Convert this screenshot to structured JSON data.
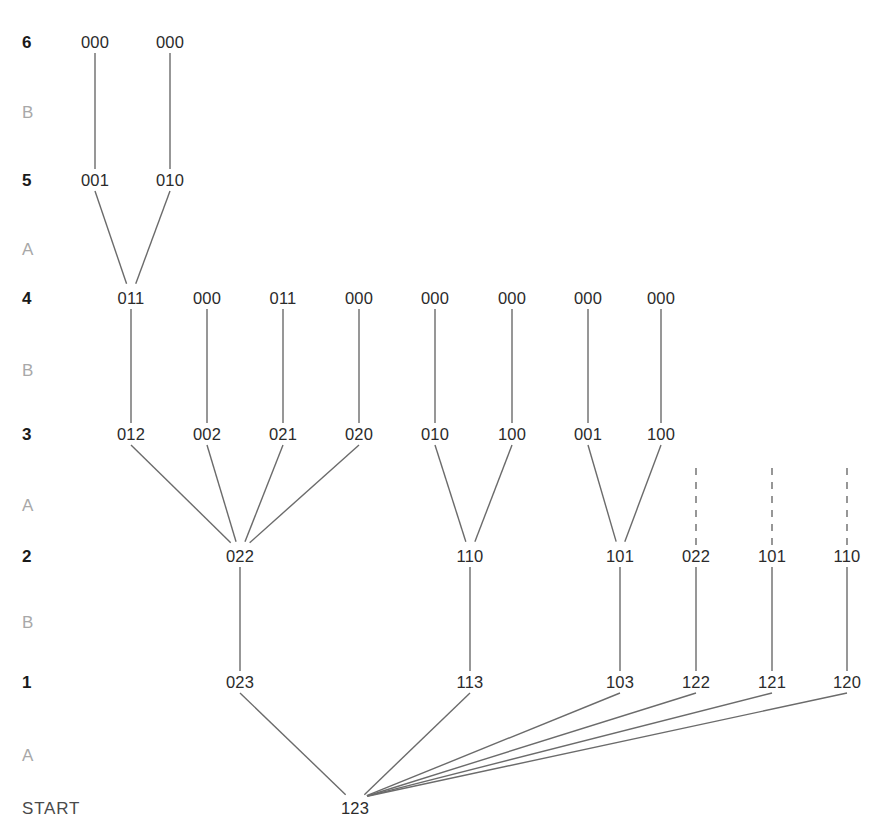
{
  "diagram": {
    "background_color": "#ffffff",
    "edge_color": "#6b6b6b",
    "node_text_color": "#2b2b2b",
    "level_label_color": "#1a1a1a",
    "phase_label_color": "#a8a8a8",
    "start_label_color": "#4a4a4a"
  },
  "axis": {
    "rows": [
      {
        "id": "lvl6",
        "label": "6",
        "kind": "level",
        "y": 42
      },
      {
        "id": "phB3",
        "label": "B",
        "kind": "phase",
        "y": 112
      },
      {
        "id": "lvl5",
        "label": "5",
        "kind": "level",
        "y": 180
      },
      {
        "id": "phA3",
        "label": "A",
        "kind": "phase",
        "y": 249
      },
      {
        "id": "lvl4",
        "label": "4",
        "kind": "level",
        "y": 298
      },
      {
        "id": "phB2",
        "label": "B",
        "kind": "phase",
        "y": 370
      },
      {
        "id": "lvl3",
        "label": "3",
        "kind": "level",
        "y": 434
      },
      {
        "id": "phA2",
        "label": "A",
        "kind": "phase",
        "y": 505
      },
      {
        "id": "lvl2",
        "label": "2",
        "kind": "level",
        "y": 556
      },
      {
        "id": "phB1",
        "label": "B",
        "kind": "phase",
        "y": 622
      },
      {
        "id": "lvl1",
        "label": "1",
        "kind": "level",
        "y": 682
      },
      {
        "id": "phA1",
        "label": "A",
        "kind": "phase",
        "y": 755
      },
      {
        "id": "start",
        "label": "START",
        "kind": "start",
        "y": 808
      }
    ],
    "x": 22
  },
  "nodes": [
    {
      "id": "n6a",
      "label": "000",
      "x": 95,
      "y": 42,
      "row": "6"
    },
    {
      "id": "n6b",
      "label": "000",
      "x": 170,
      "y": 42,
      "row": "6"
    },
    {
      "id": "n5a",
      "label": "001",
      "x": 95,
      "y": 180,
      "row": "5"
    },
    {
      "id": "n5b",
      "label": "010",
      "x": 170,
      "y": 180,
      "row": "5"
    },
    {
      "id": "n4a",
      "label": "011",
      "x": 131,
      "y": 298,
      "row": "4"
    },
    {
      "id": "n4b",
      "label": "000",
      "x": 207,
      "y": 298,
      "row": "4"
    },
    {
      "id": "n4c",
      "label": "011",
      "x": 283,
      "y": 298,
      "row": "4"
    },
    {
      "id": "n4d",
      "label": "000",
      "x": 359,
      "y": 298,
      "row": "4"
    },
    {
      "id": "n4e",
      "label": "000",
      "x": 435,
      "y": 298,
      "row": "4"
    },
    {
      "id": "n4f",
      "label": "000",
      "x": 512,
      "y": 298,
      "row": "4"
    },
    {
      "id": "n4g",
      "label": "000",
      "x": 588,
      "y": 298,
      "row": "4"
    },
    {
      "id": "n4h",
      "label": "000",
      "x": 661,
      "y": 298,
      "row": "4"
    },
    {
      "id": "n3a",
      "label": "012",
      "x": 131,
      "y": 434,
      "row": "3"
    },
    {
      "id": "n3b",
      "label": "002",
      "x": 207,
      "y": 434,
      "row": "3"
    },
    {
      "id": "n3c",
      "label": "021",
      "x": 283,
      "y": 434,
      "row": "3"
    },
    {
      "id": "n3d",
      "label": "020",
      "x": 359,
      "y": 434,
      "row": "3"
    },
    {
      "id": "n3e",
      "label": "010",
      "x": 435,
      "y": 434,
      "row": "3"
    },
    {
      "id": "n3f",
      "label": "100",
      "x": 512,
      "y": 434,
      "row": "3"
    },
    {
      "id": "n3g",
      "label": "001",
      "x": 588,
      "y": 434,
      "row": "3"
    },
    {
      "id": "n3h",
      "label": "100",
      "x": 661,
      "y": 434,
      "row": "3"
    },
    {
      "id": "n2a",
      "label": "022",
      "x": 240,
      "y": 556,
      "row": "2"
    },
    {
      "id": "n2b",
      "label": "110",
      "x": 470,
      "y": 556,
      "row": "2"
    },
    {
      "id": "n2c",
      "label": "101",
      "x": 620,
      "y": 556,
      "row": "2"
    },
    {
      "id": "n2d",
      "label": "022",
      "x": 696,
      "y": 556,
      "row": "2"
    },
    {
      "id": "n2e",
      "label": "101",
      "x": 772,
      "y": 556,
      "row": "2"
    },
    {
      "id": "n2f",
      "label": "110",
      "x": 847,
      "y": 556,
      "row": "2"
    },
    {
      "id": "n1a",
      "label": "023",
      "x": 240,
      "y": 682,
      "row": "1"
    },
    {
      "id": "n1b",
      "label": "113",
      "x": 470,
      "y": 682,
      "row": "1"
    },
    {
      "id": "n1c",
      "label": "103",
      "x": 620,
      "y": 682,
      "row": "1"
    },
    {
      "id": "n1d",
      "label": "122",
      "x": 696,
      "y": 682,
      "row": "1"
    },
    {
      "id": "n1e",
      "label": "121",
      "x": 772,
      "y": 682,
      "row": "1"
    },
    {
      "id": "n1f",
      "label": "120",
      "x": 847,
      "y": 682,
      "row": "1"
    },
    {
      "id": "n0",
      "label": "123",
      "x": 355,
      "y": 808,
      "row": "START"
    }
  ],
  "edges": [
    {
      "from": "n5a",
      "to": "n6a",
      "style": "solid"
    },
    {
      "from": "n5b",
      "to": "n6b",
      "style": "solid"
    },
    {
      "from": "n4a",
      "to": "n5a",
      "style": "solid"
    },
    {
      "from": "n4a",
      "to": "n5b",
      "style": "solid"
    },
    {
      "from": "n3a",
      "to": "n4a",
      "style": "solid"
    },
    {
      "from": "n3b",
      "to": "n4b",
      "style": "solid"
    },
    {
      "from": "n3c",
      "to": "n4c",
      "style": "solid"
    },
    {
      "from": "n3d",
      "to": "n4d",
      "style": "solid"
    },
    {
      "from": "n3e",
      "to": "n4e",
      "style": "solid"
    },
    {
      "from": "n3f",
      "to": "n4f",
      "style": "solid"
    },
    {
      "from": "n3g",
      "to": "n4g",
      "style": "solid"
    },
    {
      "from": "n3h",
      "to": "n4h",
      "style": "solid"
    },
    {
      "from": "n2a",
      "to": "n3a",
      "style": "solid"
    },
    {
      "from": "n2a",
      "to": "n3b",
      "style": "solid"
    },
    {
      "from": "n2a",
      "to": "n3c",
      "style": "solid"
    },
    {
      "from": "n2a",
      "to": "n3d",
      "style": "solid"
    },
    {
      "from": "n2b",
      "to": "n3e",
      "style": "solid"
    },
    {
      "from": "n2b",
      "to": "n3f",
      "style": "solid"
    },
    {
      "from": "n2c",
      "to": "n3g",
      "style": "solid"
    },
    {
      "from": "n2c",
      "to": "n3h",
      "style": "solid"
    },
    {
      "from": "n2d",
      "to": null,
      "style": "dashed",
      "stub_to_y": 463
    },
    {
      "from": "n2e",
      "to": null,
      "style": "dashed",
      "stub_to_y": 463
    },
    {
      "from": "n2f",
      "to": null,
      "style": "dashed",
      "stub_to_y": 463
    },
    {
      "from": "n1a",
      "to": "n2a",
      "style": "solid"
    },
    {
      "from": "n1b",
      "to": "n2b",
      "style": "solid"
    },
    {
      "from": "n1c",
      "to": "n2c",
      "style": "solid"
    },
    {
      "from": "n1d",
      "to": "n2d",
      "style": "solid"
    },
    {
      "from": "n1e",
      "to": "n2e",
      "style": "solid"
    },
    {
      "from": "n1f",
      "to": "n2f",
      "style": "solid"
    },
    {
      "from": "n0",
      "to": "n1a",
      "style": "solid"
    },
    {
      "from": "n0",
      "to": "n1b",
      "style": "solid"
    },
    {
      "from": "n0",
      "to": "n1c",
      "style": "solid"
    },
    {
      "from": "n0",
      "to": "n1d",
      "style": "solid"
    },
    {
      "from": "n0",
      "to": "n1e",
      "style": "solid"
    },
    {
      "from": "n0",
      "to": "n1f",
      "style": "solid"
    }
  ]
}
